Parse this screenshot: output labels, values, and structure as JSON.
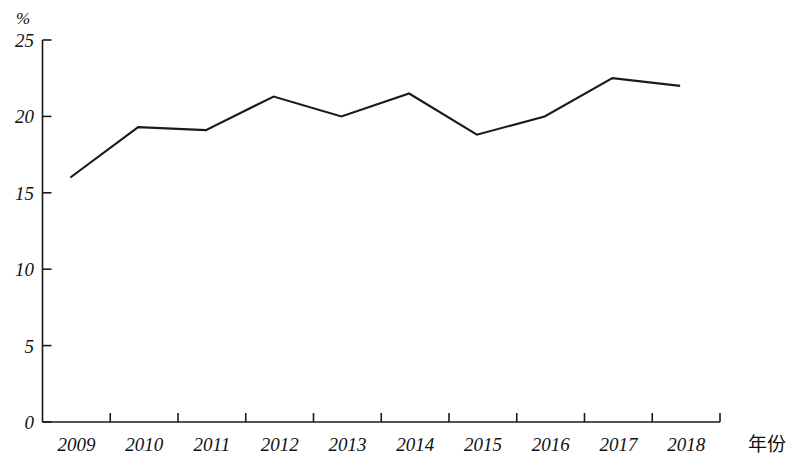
{
  "chart_data": {
    "type": "line",
    "title": "",
    "subtitle": "",
    "xlabel": "年份",
    "ylabel": "%",
    "categories": [
      "2009",
      "2010",
      "2011",
      "2012",
      "2013",
      "2014",
      "2015",
      "2016",
      "2017",
      "2018"
    ],
    "x": [
      2009,
      2010,
      2011,
      2012,
      2013,
      2014,
      2015,
      2016,
      2017,
      2018
    ],
    "values": [
      16.0,
      19.3,
      19.1,
      21.3,
      20.0,
      21.5,
      18.8,
      20.0,
      22.5,
      22.0
    ],
    "series": [
      {
        "name": "",
        "values": [
          16.0,
          19.3,
          19.1,
          21.3,
          20.0,
          21.5,
          18.8,
          20.0,
          22.5,
          22.0
        ]
      }
    ],
    "ylim": [
      0,
      25
    ],
    "ytick_labels": [
      "0",
      "5",
      "10",
      "15",
      "20",
      "25"
    ],
    "ytick_values": [
      0,
      5,
      10,
      15,
      20,
      25
    ],
    "grid": false,
    "legend": "none",
    "line_color": "#1a1a1a",
    "axis_color": "#1a1a1a",
    "markers": false,
    "annotations": []
  },
  "axes": {
    "y_unit_label": "%",
    "x_title": "年份"
  }
}
